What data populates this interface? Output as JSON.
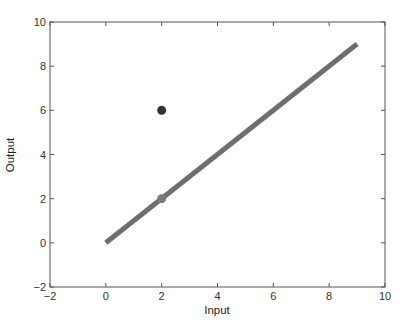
{
  "chart_data": {
    "type": "line",
    "title": "",
    "xlabel": "Input",
    "ylabel": "Output",
    "xlim": [
      -2,
      10
    ],
    "ylim": [
      -2,
      10
    ],
    "xticks": [
      -2,
      0,
      2,
      4,
      6,
      8,
      10
    ],
    "yticks": [
      -2,
      0,
      2,
      4,
      6,
      8,
      10
    ],
    "grid": false,
    "legend": null,
    "series": [
      {
        "name": "line",
        "kind": "line",
        "x": [
          0,
          9
        ],
        "y": [
          0,
          9
        ],
        "color": "#6e6e6e",
        "linewidth": 5
      },
      {
        "name": "point-dark",
        "kind": "scatter",
        "x": [
          2
        ],
        "y": [
          6
        ],
        "color": "#333333"
      },
      {
        "name": "point-on-line",
        "kind": "scatter",
        "x": [
          2
        ],
        "y": [
          2
        ],
        "color": "#7a7a7a"
      }
    ]
  },
  "axes": {
    "x_tick_labels": [
      "−2",
      "0",
      "2",
      "4",
      "6",
      "8",
      "10"
    ],
    "y_tick_labels": [
      "−2",
      "0",
      "2",
      "4",
      "6",
      "8",
      "10"
    ]
  }
}
